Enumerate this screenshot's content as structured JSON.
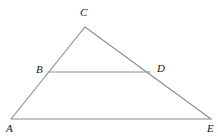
{
  "figure": {
    "kind": "geometry-diagram",
    "background_color": "#ffffff",
    "line_color": "#8a8a8a",
    "label_color": "#161616",
    "width": 218,
    "height": 138
  },
  "points": {
    "A": {
      "label": "A",
      "x": 11,
      "y": 119,
      "label_x": 6,
      "label_y": 123
    },
    "B": {
      "label": "B",
      "x": 48,
      "y": 72,
      "label_x": 36,
      "label_y": 64
    },
    "C": {
      "label": "C",
      "x": 85,
      "y": 27,
      "label_x": 80,
      "label_y": 7
    },
    "D": {
      "label": "D",
      "x": 150,
      "y": 72,
      "label_x": 157,
      "label_y": 63
    },
    "E": {
      "label": "E",
      "x": 211,
      "y": 119,
      "label_x": 207,
      "label_y": 123
    }
  },
  "segments": [
    {
      "name": "side-AC",
      "from": "A",
      "to": "C",
      "style": "edge"
    },
    {
      "name": "side-CE",
      "from": "C",
      "to": "E",
      "style": "edge"
    },
    {
      "name": "base-AE",
      "from": "A",
      "to": "E",
      "style": "edge"
    },
    {
      "name": "segment-BD",
      "from": "B",
      "to": "D",
      "style": "cevian"
    }
  ],
  "polyline_outer": "11,119 85,27 211,119 11,119",
  "polyline_inner": "48,72 150,72"
}
